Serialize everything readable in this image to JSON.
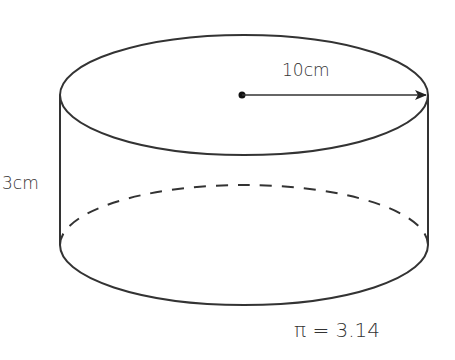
{
  "diagram": {
    "type": "cylinder",
    "labels": {
      "radius": "10cm",
      "height": "3cm",
      "pi": "π = 3.14"
    },
    "values": {
      "radius_cm": 10,
      "height_cm": 3,
      "pi": 3.14
    },
    "colors": {
      "stroke": "#333333",
      "background": "#ffffff"
    }
  }
}
